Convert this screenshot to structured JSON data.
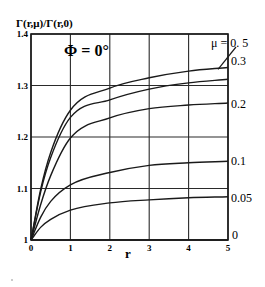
{
  "chart_data": {
    "type": "line",
    "title": "",
    "ylabel": "Γ(r,μ)/Γ(r,0)",
    "xlabel": "r",
    "annotation": "Φ = 0°",
    "xlim": [
      0,
      5
    ],
    "ylim": [
      1.0,
      1.4
    ],
    "xticks": [
      "0",
      "1",
      "2",
      "3",
      "4",
      "5"
    ],
    "yticks": [
      "1",
      "1.1",
      "1.2",
      "1.3",
      "1.4"
    ],
    "grid": true,
    "legend_position": "inline-right",
    "x": [
      0,
      0.25,
      0.5,
      1,
      2,
      3,
      4,
      5
    ],
    "series": [
      {
        "name": "μ = 0.5",
        "label": "μ = 0. 5",
        "values": [
          1.0,
          1.1,
          1.17,
          1.252,
          1.295,
          1.315,
          1.328,
          1.335
        ]
      },
      {
        "name": "μ = 0.3",
        "label": "0.3",
        "values": [
          1.0,
          1.095,
          1.16,
          1.238,
          1.272,
          1.293,
          1.305,
          1.312
        ]
      },
      {
        "name": "μ = 0.2",
        "label": "0.2",
        "values": [
          1.0,
          1.07,
          1.125,
          1.198,
          1.237,
          1.255,
          1.262,
          1.266
        ]
      },
      {
        "name": "μ = 0.1",
        "label": "0.1",
        "values": [
          1.0,
          1.045,
          1.075,
          1.107,
          1.131,
          1.145,
          1.15,
          1.153
        ]
      },
      {
        "name": "μ = 0.05",
        "label": "0.05",
        "values": [
          1.0,
          1.025,
          1.04,
          1.058,
          1.072,
          1.078,
          1.082,
          1.084
        ]
      },
      {
        "name": "μ = 0",
        "label": "0",
        "values": [
          1.0,
          1.0,
          1.0,
          1.0,
          1.0,
          1.0,
          1.0,
          1.0
        ]
      }
    ]
  }
}
